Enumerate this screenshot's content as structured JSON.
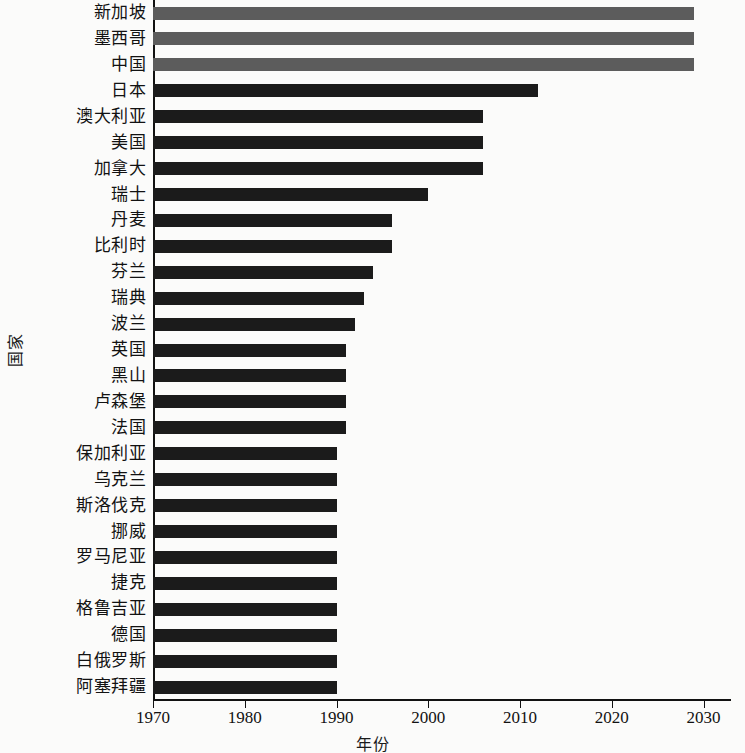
{
  "chart_data": {
    "type": "bar",
    "orientation": "horizontal",
    "title": "",
    "xlabel": "年份",
    "ylabel": "国家",
    "xlim": [
      1970,
      2033
    ],
    "xticks": [
      1970,
      1980,
      1990,
      2000,
      2010,
      2020,
      2030
    ],
    "xtick_labels": [
      "1970",
      "1980",
      "1990",
      "2000",
      "2010",
      "2020",
      "2030"
    ],
    "grid": false,
    "legend": "none",
    "bar_base": 1970,
    "colors": {
      "bar": "#1b1b1b",
      "bar_highlight": "#5c5c5c",
      "axis": "#111111",
      "background": "#fbfbfa"
    },
    "categories": [
      "新加坡",
      "墨西哥",
      "中国",
      "日本",
      "澳大利亚",
      "美国",
      "加拿大",
      "瑞士",
      "丹麦",
      "比利时",
      "芬兰",
      "瑞典",
      "波兰",
      "英国",
      "黑山",
      "卢森堡",
      "法国",
      "保加利亚",
      "乌克兰",
      "斯洛伐克",
      "挪威",
      "罗马尼亚",
      "捷克",
      "格鲁吉亚",
      "德国",
      "白俄罗斯",
      "阿塞拜疆"
    ],
    "values": [
      2029,
      2029,
      2029,
      2012,
      2006,
      2006,
      2006,
      2000,
      1996,
      1996,
      1994,
      1993,
      1992,
      1991,
      1991,
      1991,
      1991,
      1990,
      1990,
      1990,
      1990,
      1990,
      1990,
      1990,
      1990,
      1990,
      1990
    ],
    "highlight_indices": [
      0,
      1,
      2
    ]
  }
}
